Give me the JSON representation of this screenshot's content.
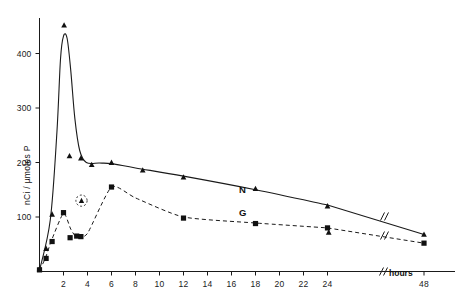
{
  "chart_data": {
    "type": "line",
    "title": "",
    "xlabel": "hours",
    "ylabel": "nCi / µmoles P",
    "xlim": [
      0,
      48
    ],
    "ylim": [
      0,
      460
    ],
    "grid": false,
    "legend": "inline-curve-labels",
    "axis_break_x": true,
    "axis_break_note": "//",
    "xticks": [
      {
        "value": 2,
        "label": "2"
      },
      {
        "value": 4,
        "label": "4"
      },
      {
        "value": 6,
        "label": "6"
      },
      {
        "value": 8,
        "label": "8"
      },
      {
        "value": 10,
        "label": "10"
      },
      {
        "value": 12,
        "label": "12"
      },
      {
        "value": 14,
        "label": "14"
      },
      {
        "value": 16,
        "label": "16"
      },
      {
        "value": 18,
        "label": "18"
      },
      {
        "value": 20,
        "label": "20"
      },
      {
        "value": 22,
        "label": "22"
      },
      {
        "value": 24,
        "label": "24"
      },
      {
        "value": 48,
        "label": "48"
      }
    ],
    "yticks": [
      {
        "value": 100,
        "label": "100"
      },
      {
        "value": 200,
        "label": "200"
      },
      {
        "value": 300,
        "label": "300"
      },
      {
        "value": 400,
        "label": "400"
      }
    ],
    "series": [
      {
        "name": "N",
        "label": "N",
        "style": "solid",
        "marker": "triangle",
        "color": "#1a1a1a",
        "x": [
          0,
          0.5,
          1,
          2,
          3,
          4,
          6,
          12,
          18,
          24,
          48
        ],
        "values": [
          5,
          40,
          105,
          440,
          205,
          195,
          200,
          175,
          150,
          118,
          68
        ]
      },
      {
        "name": "G",
        "label": "G",
        "style": "dashed",
        "marker": "square",
        "color": "#1a1a1a",
        "x": [
          0,
          0.5,
          1,
          2,
          3,
          3.5,
          4,
          6,
          12,
          18,
          24,
          48
        ],
        "values": [
          5,
          25,
          55,
          105,
          62,
          130,
          70,
          155,
          98,
          88,
          80,
          52
        ]
      }
    ],
    "annotations": [
      {
        "text": "N",
        "x": 19,
        "y": 190,
        "kind": "curve-label"
      },
      {
        "text": "G",
        "x": 19,
        "y": 103,
        "kind": "curve-label"
      },
      {
        "text": "hours",
        "x": 42,
        "y": -30,
        "kind": "axis-label"
      },
      {
        "text": "circled-triangle",
        "x": 3.5,
        "y": 130,
        "kind": "highlighted-point"
      }
    ],
    "extra_points": [
      {
        "series": "N",
        "x": 24,
        "y": 72,
        "marker": "triangle"
      },
      {
        "series": "G",
        "x": 3.5,
        "y": 130,
        "marker": "circled-triangle"
      }
    ]
  },
  "axes": {
    "y_axis_title": "nCi / µmoles P",
    "x_axis_title": "hours",
    "break_symbol": "//"
  },
  "curve_labels": {
    "n": "N",
    "g": "G"
  }
}
